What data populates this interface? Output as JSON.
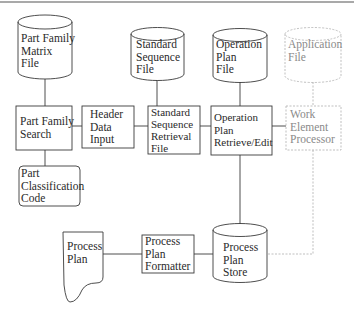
{
  "diagram": {
    "colors": {
      "line": "#3a3a3a",
      "faded_line": "#b8b8b8",
      "faded_text": "#8a8a8a",
      "background": "#ffffff"
    },
    "nodes": {
      "part_family_matrix_file": {
        "type": "database",
        "lines": [
          "Part Family",
          "Matrix",
          "File"
        ]
      },
      "standard_sequence_file": {
        "type": "database",
        "lines": [
          "Standard",
          "Sequence",
          "File"
        ]
      },
      "operation_plan_file": {
        "type": "database",
        "lines": [
          "Operation",
          "Plan",
          "File"
        ]
      },
      "application_file": {
        "type": "database",
        "style": "dashed",
        "lines": [
          "Application",
          "File"
        ]
      },
      "part_family_search": {
        "type": "process",
        "lines": [
          "Part Family",
          "Search"
        ]
      },
      "header_data_input": {
        "type": "process",
        "lines": [
          "Header",
          "Data",
          "Input"
        ]
      },
      "standard_sequence_retrieval_file": {
        "type": "process",
        "lines": [
          "Standard",
          "Sequence",
          "Retrieval",
          "File"
        ]
      },
      "operation_plan_retrieve_edit": {
        "type": "process",
        "lines": [
          "Operation",
          "Plan",
          "Retrieve/Edit"
        ]
      },
      "work_element_processor": {
        "type": "process",
        "style": "dashed",
        "lines": [
          "Work",
          "Element",
          "Processor"
        ]
      },
      "part_classification_code": {
        "type": "terminal",
        "lines": [
          "Part",
          "Classification",
          "Code"
        ]
      },
      "process_plan": {
        "type": "document",
        "lines": [
          "Process",
          "Plan"
        ]
      },
      "process_plan_formatter": {
        "type": "process",
        "lines": [
          "Process",
          "Plan",
          "Formatter"
        ]
      },
      "process_plan_store": {
        "type": "database",
        "lines": [
          "Process",
          "Plan",
          "Store"
        ]
      }
    },
    "edges": [
      [
        "part_family_matrix_file",
        "part_family_search"
      ],
      [
        "part_family_search",
        "header_data_input"
      ],
      [
        "part_family_search",
        "part_classification_code"
      ],
      [
        "header_data_input",
        "standard_sequence_retrieval_file"
      ],
      [
        "standard_sequence_file",
        "standard_sequence_retrieval_file"
      ],
      [
        "standard_sequence_retrieval_file",
        "operation_plan_retrieve_edit"
      ],
      [
        "operation_plan_file",
        "operation_plan_retrieve_edit"
      ],
      [
        "operation_plan_retrieve_edit",
        "work_element_processor"
      ],
      [
        "application_file",
        "work_element_processor"
      ],
      [
        "operation_plan_retrieve_edit",
        "process_plan_store"
      ],
      [
        "work_element_processor",
        "process_plan_store"
      ],
      [
        "process_plan_store",
        "process_plan_formatter"
      ],
      [
        "process_plan_formatter",
        "process_plan"
      ]
    ]
  }
}
